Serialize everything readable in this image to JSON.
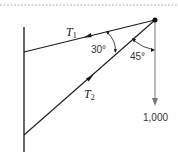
{
  "diagram": {
    "type": "force-diagram",
    "tensions": [
      {
        "symbol": "T",
        "subscript": "1",
        "angle_label": "30°"
      },
      {
        "symbol": "T",
        "subscript": "2",
        "angle_label": "45°"
      }
    ],
    "load": {
      "label": "1,000"
    },
    "colors": {
      "line": "#1a1a1a",
      "load": "#777777",
      "dashed": "#999999"
    }
  }
}
